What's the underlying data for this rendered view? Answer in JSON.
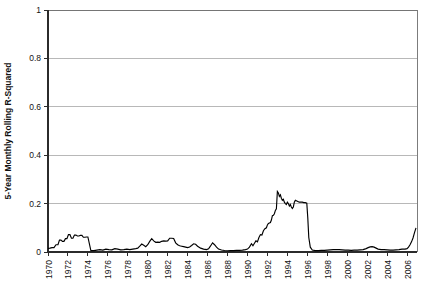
{
  "chart_data": {
    "type": "line",
    "title": "",
    "subtitle": "",
    "xlabel": "",
    "ylabel": "5-Year Monthly Rolling R-Squared",
    "xlim": [
      1970,
      2007
    ],
    "ylim": [
      0,
      1
    ],
    "grid": "horizontal",
    "legend": "none",
    "y_ticks": [
      "0",
      "0.2",
      "0.4",
      "0.6",
      "0.8",
      "1"
    ],
    "y_tick_values": [
      0,
      0.2,
      0.4,
      0.6,
      0.8,
      1
    ],
    "x_ticks": [
      "1970",
      "1972",
      "1974",
      "1976",
      "1978",
      "1980",
      "1982",
      "1984",
      "1986",
      "1988",
      "1990",
      "1992",
      "1994",
      "1996",
      "1998",
      "2000",
      "2002",
      "2004",
      "2006"
    ],
    "x_tick_values": [
      1970,
      1972,
      1974,
      1976,
      1978,
      1980,
      1982,
      1984,
      1986,
      1988,
      1990,
      1992,
      1994,
      1996,
      1998,
      2000,
      2002,
      2004,
      2006
    ],
    "series": [
      {
        "name": "5-Year Monthly Rolling R-Squared",
        "color": "#000000",
        "x": [
          1970.0,
          1970.2,
          1970.4,
          1970.6,
          1970.8,
          1971.0,
          1971.15,
          1971.3,
          1971.45,
          1971.6,
          1971.75,
          1971.9,
          1972.05,
          1972.2,
          1972.35,
          1972.5,
          1972.65,
          1972.8,
          1972.95,
          1973.1,
          1973.25,
          1973.4,
          1973.55,
          1973.7,
          1973.85,
          1974.0,
          1974.3,
          1974.6,
          1974.9,
          1975.2,
          1975.5,
          1975.8,
          1976.1,
          1976.4,
          1976.7,
          1977.0,
          1977.3,
          1977.6,
          1977.9,
          1978.2,
          1978.5,
          1978.8,
          1979.0,
          1979.2,
          1979.4,
          1979.6,
          1979.8,
          1980.0,
          1980.2,
          1980.4,
          1980.6,
          1980.8,
          1981.0,
          1981.2,
          1981.4,
          1981.6,
          1981.8,
          1982.0,
          1982.2,
          1982.4,
          1982.6,
          1982.8,
          1983.0,
          1983.2,
          1983.4,
          1983.6,
          1983.8,
          1984.0,
          1984.2,
          1984.4,
          1984.6,
          1984.8,
          1985.0,
          1985.3,
          1985.6,
          1985.9,
          1986.1,
          1986.3,
          1986.5,
          1986.7,
          1986.9,
          1987.1,
          1987.4,
          1987.7,
          1988.0,
          1988.3,
          1988.6,
          1988.9,
          1989.2,
          1989.5,
          1989.8,
          1990.0,
          1990.2,
          1990.4,
          1990.55,
          1990.7,
          1990.85,
          1991.0,
          1991.15,
          1991.3,
          1991.45,
          1991.6,
          1991.75,
          1991.9,
          1992.0,
          1992.1,
          1992.2,
          1992.3,
          1992.4,
          1992.5,
          1992.6,
          1992.7,
          1992.8,
          1992.9,
          1993.0,
          1993.1,
          1993.2,
          1993.3,
          1993.4,
          1993.5,
          1993.6,
          1993.7,
          1993.8,
          1993.9,
          1994.0,
          1994.1,
          1994.2,
          1994.3,
          1994.4,
          1994.5,
          1994.6,
          1994.7,
          1994.8,
          1994.9,
          1995.0,
          1995.1,
          1995.2,
          1995.35,
          1995.5,
          1995.65,
          1995.8,
          1995.95,
          1996.05,
          1996.15,
          1996.3,
          1996.5,
          1996.8,
          1997.1,
          1997.4,
          1997.7,
          1998.0,
          1998.3,
          1998.6,
          1998.9,
          1999.2,
          1999.5,
          1999.8,
          2000.1,
          2000.4,
          2000.7,
          2001.0,
          2001.3,
          2001.6,
          2001.9,
          2002.1,
          2002.3,
          2002.5,
          2002.7,
          2002.9,
          2003.1,
          2003.4,
          2003.7,
          2004.0,
          2004.3,
          2004.6,
          2004.9,
          2005.2,
          2005.5,
          2005.8,
          2006.0,
          2006.15,
          2006.3,
          2006.45,
          2006.6,
          2006.75,
          2006.9
        ],
        "y": [
          0.015,
          0.016,
          0.018,
          0.018,
          0.03,
          0.03,
          0.049,
          0.049,
          0.044,
          0.044,
          0.055,
          0.055,
          0.072,
          0.072,
          0.057,
          0.057,
          0.07,
          0.07,
          0.066,
          0.066,
          0.069,
          0.069,
          0.061,
          0.061,
          0.062,
          0.062,
          0.006,
          0.006,
          0.008,
          0.01,
          0.008,
          0.012,
          0.01,
          0.009,
          0.014,
          0.012,
          0.009,
          0.01,
          0.012,
          0.01,
          0.012,
          0.014,
          0.016,
          0.024,
          0.033,
          0.028,
          0.022,
          0.03,
          0.044,
          0.055,
          0.046,
          0.04,
          0.041,
          0.04,
          0.044,
          0.046,
          0.045,
          0.046,
          0.057,
          0.057,
          0.056,
          0.038,
          0.03,
          0.026,
          0.024,
          0.022,
          0.02,
          0.018,
          0.021,
          0.027,
          0.034,
          0.032,
          0.024,
          0.016,
          0.012,
          0.01,
          0.013,
          0.025,
          0.038,
          0.03,
          0.02,
          0.012,
          0.008,
          0.006,
          0.005,
          0.006,
          0.006,
          0.007,
          0.007,
          0.008,
          0.01,
          0.012,
          0.02,
          0.034,
          0.026,
          0.036,
          0.046,
          0.042,
          0.06,
          0.072,
          0.07,
          0.088,
          0.096,
          0.1,
          0.112,
          0.118,
          0.12,
          0.122,
          0.132,
          0.15,
          0.152,
          0.158,
          0.172,
          0.178,
          0.25,
          0.244,
          0.23,
          0.236,
          0.222,
          0.214,
          0.218,
          0.206,
          0.2,
          0.196,
          0.206,
          0.2,
          0.19,
          0.196,
          0.186,
          0.18,
          0.186,
          0.206,
          0.214,
          0.212,
          0.21,
          0.208,
          0.206,
          0.206,
          0.206,
          0.204,
          0.204,
          0.202,
          0.14,
          0.06,
          0.02,
          0.008,
          0.006,
          0.006,
          0.007,
          0.007,
          0.008,
          0.009,
          0.01,
          0.01,
          0.01,
          0.009,
          0.008,
          0.008,
          0.007,
          0.008,
          0.008,
          0.009,
          0.01,
          0.014,
          0.018,
          0.021,
          0.022,
          0.02,
          0.016,
          0.012,
          0.01,
          0.01,
          0.009,
          0.008,
          0.008,
          0.009,
          0.01,
          0.012,
          0.012,
          0.014,
          0.02,
          0.03,
          0.042,
          0.058,
          0.08,
          0.1
        ]
      }
    ]
  }
}
